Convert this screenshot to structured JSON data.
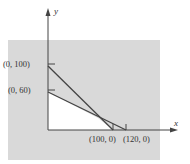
{
  "diagram": {
    "type": "linear-inequality-graph",
    "axes": {
      "x_label": "x",
      "y_label": "y"
    },
    "points": [
      {
        "label": "(0, 100)",
        "x": 0,
        "y": 100
      },
      {
        "label": "(0, 60)",
        "x": 0,
        "y": 60
      },
      {
        "label": "(100, 0)",
        "x": 100,
        "y": 0
      },
      {
        "label": "(120, 0)",
        "x": 120,
        "y": 0
      }
    ],
    "lines": [
      {
        "from": "(0, 100)",
        "to": "(100, 0)"
      },
      {
        "from": "(0, 60)",
        "to": "(120, 0)"
      }
    ],
    "colors": {
      "shade": "#d9d9d9",
      "line": "#444444",
      "background": "#ffffff"
    }
  }
}
